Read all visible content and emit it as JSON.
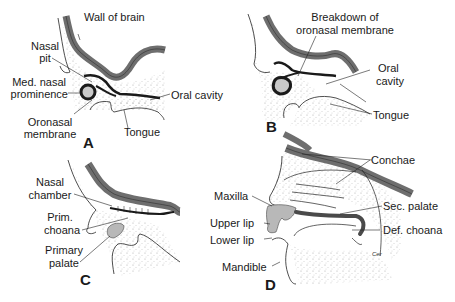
{
  "figure": {
    "colors": {
      "brain_wall": "#6e6e6e",
      "membrane": "#1a1a1a",
      "mesenchyme_stipple": "#d9d9d9",
      "palate_fill": "#b8b8b8",
      "line": "#222222"
    }
  },
  "panels": {
    "A": {
      "letter": "A",
      "labels": {
        "wall_of_brain": "Wall of brain",
        "nasal_pit_1": "Nasal",
        "nasal_pit_2": "pit",
        "med_nasal_1": "Med. nasal",
        "med_nasal_2": "prominence",
        "oral_cavity": "Oral cavity",
        "oronasal_1": "Oronasal",
        "oronasal_2": "membrane",
        "tongue": "Tongue"
      }
    },
    "B": {
      "letter": "B",
      "labels": {
        "breakdown_1": "Breakdown of",
        "breakdown_2": "oronasal membrane",
        "oral_1": "Oral",
        "oral_2": "cavity",
        "tongue": "Tongue"
      }
    },
    "C": {
      "letter": "C",
      "labels": {
        "nasal_chamber_1": "Nasal",
        "nasal_chamber_2": "chamber",
        "prim_choana_1": "Prim.",
        "prim_choana_2": "choana",
        "primary_palate_1": "Primary",
        "primary_palate_2": "palate"
      }
    },
    "D": {
      "letter": "D",
      "labels": {
        "conchae": "Conchae",
        "maxilla": "Maxilla",
        "sec_palate": "Sec. palate",
        "upper_lip": "Upper lip",
        "def_choana": "Def. choana",
        "lower_lip": "Lower lip",
        "mandible": "Mandible",
        "artist_mark": "Cer"
      }
    }
  }
}
